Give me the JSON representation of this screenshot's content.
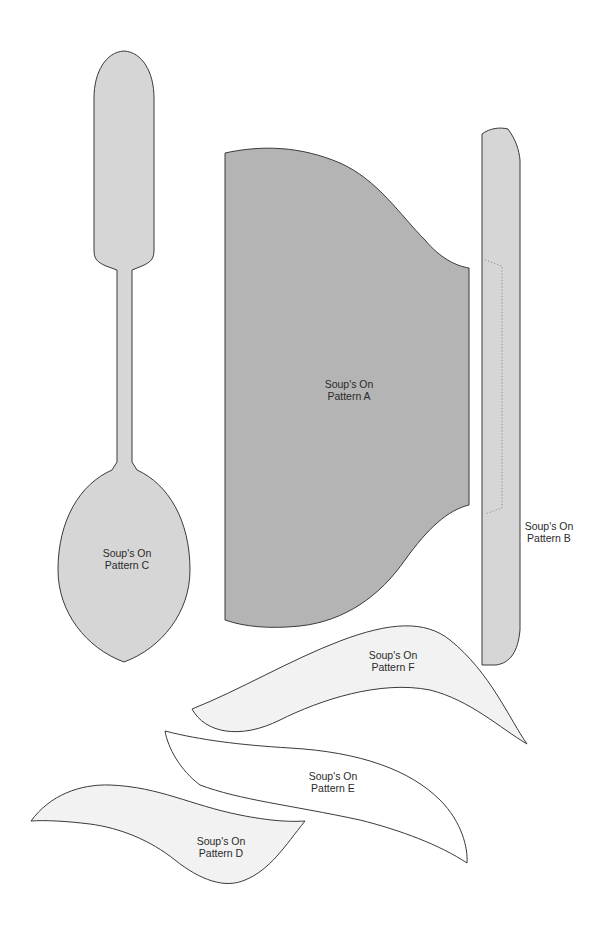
{
  "sheet": {
    "title": "Soup's On pattern pieces"
  },
  "patterns": {
    "a": {
      "line1": "Soup's On",
      "line2": "Pattern A",
      "fill": "#b4b4b4"
    },
    "b": {
      "line1": "Soup's On",
      "line2": "Pattern B",
      "fill": "#d6d6d6"
    },
    "c": {
      "line1": "Soup's On",
      "line2": "Pattern C",
      "fill": "#d6d6d6"
    },
    "d": {
      "line1": "Soup's On",
      "line2": "Pattern D",
      "fill": "#f2f2f2"
    },
    "e": {
      "line1": "Soup's On",
      "line2": "Pattern E",
      "fill": "#ffffff"
    },
    "f": {
      "line1": "Soup's On",
      "line2": "Pattern F",
      "fill": "#f2f2f2"
    }
  }
}
